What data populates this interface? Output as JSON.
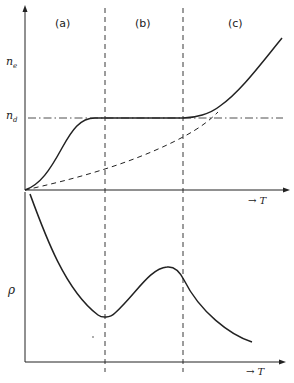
{
  "figure": {
    "regions": [
      {
        "label": "(a)"
      },
      {
        "label": "(b)"
      },
      {
        "label": "(c)"
      }
    ],
    "top_panel": {
      "y_label_main": "n",
      "y_label_sub": "e",
      "level_label_main": "n",
      "level_label_sub": "d",
      "x_label": "→ T"
    },
    "bottom_panel": {
      "y_label": "ρ",
      "x_label": "→ T"
    },
    "colors": {
      "ink": "#222222",
      "background": "#ffffff"
    }
  }
}
